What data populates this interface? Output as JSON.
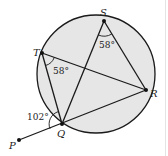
{
  "diagram": {
    "type": "circle-geometry",
    "colors": {
      "circle_fill": "#e6e6e6",
      "stroke": "#1a1a1a",
      "background": "#ffffff"
    },
    "circle": {
      "cx": 96,
      "cy": 74,
      "r": 59
    },
    "points": {
      "S": {
        "label": "S",
        "x": 104,
        "y": 21
      },
      "T": {
        "label": "T",
        "x": 42,
        "y": 53
      },
      "R": {
        "label": "R",
        "x": 146,
        "y": 90
      },
      "Q": {
        "label": "Q",
        "x": 62,
        "y": 124
      },
      "P": {
        "label": "P",
        "x": 19,
        "y": 140
      }
    },
    "angles": {
      "angle_S": "58°",
      "angle_T": "58°",
      "angle_Q_exterior": "102°"
    }
  }
}
